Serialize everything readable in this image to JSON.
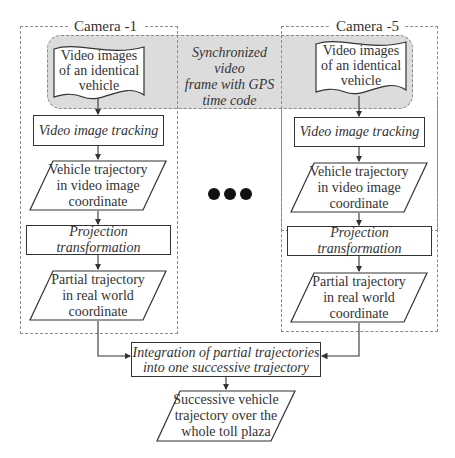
{
  "diagram": {
    "camera_left": {
      "label": "Camera -1",
      "source": "Video images\nof an identical\nvehicle",
      "tracking": "Video image tracking",
      "trajectory_video": "Vehicle trajectory\nin video image\ncoordinate",
      "projection": "Projection transformation",
      "trajectory_real": "Partial trajectory\nin real world\ncoordinate"
    },
    "camera_right": {
      "label": "Camera -5",
      "source": "Video images\nof an identical\nvehicle",
      "tracking": "Video image tracking",
      "trajectory_video": "Vehicle trajectory\nin video image\ncoordinate",
      "projection": "Projection transformation",
      "trajectory_real": "Partial trajectory\nin real world\ncoordinate"
    },
    "sync_band": {
      "text": "Synchronized video\nframe with GPS\ntime code",
      "fill": "#dcdcdc"
    },
    "ellipsis": "●●●",
    "integration": "Integration of  partial trajectories\ninto one successive trajectory",
    "output": "Successive vehicle\ntrajectory over the\nwhole toll plaza"
  }
}
